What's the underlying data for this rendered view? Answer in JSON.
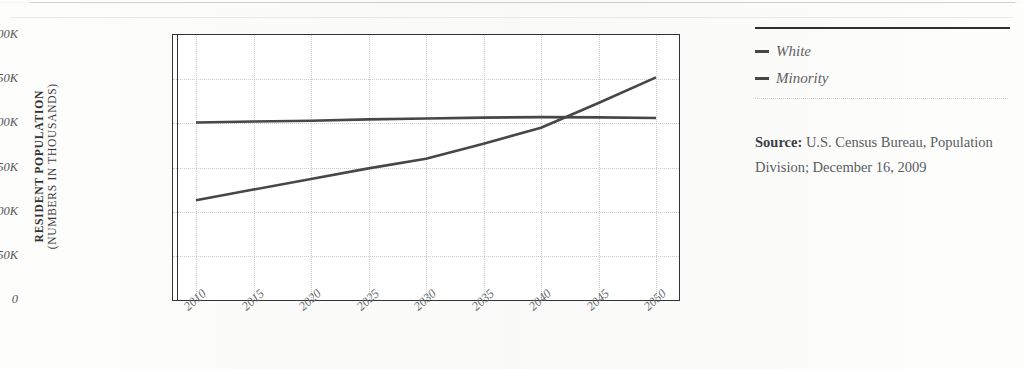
{
  "figure": {
    "y_axis_title_main": "RESIDENT POPULATION",
    "y_axis_title_sub": "(NUMBERS IN THOUSANDS)"
  },
  "legend": {
    "items": [
      {
        "label": "White",
        "color": "#474747"
      },
      {
        "label": "Minority",
        "color": "#474747"
      }
    ]
  },
  "source": {
    "label": "Source:",
    "text": " U.S. Census Bureau, Population Division; December 16, 2009"
  },
  "colors": {
    "line": "#474747",
    "axis": "#333333",
    "grid": "#c9ccd0",
    "tick_text": "#5a5d61",
    "rule": "#2f2f31"
  },
  "chart_data": {
    "type": "line",
    "title": "",
    "xlabel": "",
    "ylabel": "RESIDENT POPULATION (NUMBERS IN THOUSANDS)",
    "x": [
      2010,
      2015,
      2020,
      2025,
      2030,
      2035,
      2040,
      2045,
      2050
    ],
    "xtick_labels": [
      "2010",
      "2015",
      "2020",
      "2025",
      "2030",
      "2035",
      "2040",
      "2045",
      "2050"
    ],
    "ytick_labels": [
      "0",
      "50K",
      "100K",
      "150K",
      "200K",
      "250K",
      "300K"
    ],
    "ytick_values": [
      0,
      50000,
      100000,
      150000,
      200000,
      250000,
      300000
    ],
    "xlim": [
      2008,
      2052
    ],
    "ylim": [
      0,
      300000
    ],
    "grid": true,
    "legend_position": "right",
    "series": [
      {
        "name": "White",
        "color": "#474747",
        "values": [
          201000,
          202000,
          203000,
          204500,
          205500,
          206500,
          207000,
          206800,
          206000
        ]
      },
      {
        "name": "Minority",
        "color": "#474747",
        "values": [
          113000,
          125000,
          137000,
          149000,
          160000,
          177000,
          195000,
          223000,
          252000
        ]
      }
    ],
    "annotations": [
      {
        "text": "crossover",
        "x": 2039,
        "y": 207000
      }
    ]
  }
}
